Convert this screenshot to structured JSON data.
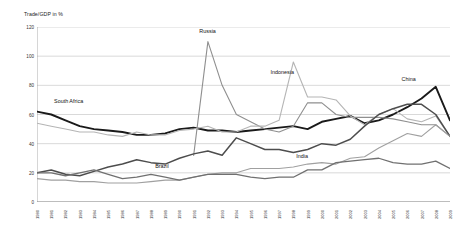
{
  "chart_data": {
    "type": "line",
    "title": "",
    "ylabel": "Trade/GDP in %",
    "xlabel": "",
    "ylim": [
      0,
      120
    ],
    "yticks": [
      0,
      20,
      40,
      60,
      80,
      100,
      120
    ],
    "grid": true,
    "legend_position": "inline-annotations",
    "x": [
      1980,
      1981,
      1982,
      1983,
      1984,
      1985,
      1986,
      1987,
      1988,
      1989,
      1990,
      1991,
      1992,
      1993,
      1994,
      1995,
      1996,
      1997,
      1998,
      1999,
      2000,
      2001,
      2002,
      2003,
      2004,
      2005,
      2006,
      2007,
      2008,
      2009
    ],
    "series": [
      {
        "name": "South Africa",
        "color": "#1a1a1a",
        "width": 1.9,
        "label_x": 1981.2,
        "label_y": 68,
        "values": [
          62,
          60,
          56,
          52,
          50,
          49,
          48,
          46,
          46,
          47,
          50,
          51,
          49,
          49,
          48,
          49,
          50,
          51,
          52,
          50,
          55,
          57,
          59,
          54,
          56,
          60,
          65,
          71,
          79,
          56
        ]
      },
      {
        "name": "Russia",
        "color": "#8f8f8f",
        "width": 1.1,
        "label_x": 1991.4,
        "label_y": 116,
        "values": [
          null,
          null,
          null,
          null,
          null,
          null,
          null,
          null,
          null,
          null,
          null,
          32,
          110,
          80,
          60,
          55,
          50,
          48,
          52,
          68,
          68,
          60,
          58,
          58,
          58,
          57,
          55,
          53,
          53,
          45
        ]
      },
      {
        "name": "Indonesia",
        "color": "#b5b5b5",
        "width": 1.1,
        "label_x": 1996.4,
        "label_y": 88,
        "values": [
          54,
          52,
          50,
          48,
          48,
          46,
          45,
          48,
          46,
          46,
          49,
          50,
          52,
          48,
          48,
          52,
          52,
          56,
          96,
          72,
          72,
          70,
          59,
          53,
          60,
          64,
          57,
          55,
          59,
          45
        ]
      },
      {
        "name": "China",
        "color": "#4d4d4d",
        "width": 1.5,
        "label_x": 2005.6,
        "label_y": 83,
        "values": [
          20,
          22,
          19,
          18,
          21,
          24,
          26,
          29,
          27,
          26,
          30,
          33,
          35,
          32,
          44,
          40,
          36,
          36,
          34,
          36,
          40,
          39,
          43,
          52,
          60,
          64,
          67,
          67,
          60,
          45
        ]
      },
      {
        "name": "India",
        "color": "#a0a0a0",
        "width": 1.1,
        "label_x": 1998.2,
        "label_y": 30,
        "values": [
          16,
          15,
          15,
          14,
          14,
          13,
          13,
          13,
          14,
          15,
          15,
          17,
          19,
          20,
          20,
          23,
          23,
          23,
          24,
          26,
          27,
          26,
          30,
          31,
          37,
          42,
          47,
          45,
          53,
          45
        ]
      },
      {
        "name": "Brazil",
        "color": "#707070",
        "width": 1.3,
        "label_x": 1988.3,
        "label_y": 23,
        "values": [
          20,
          20,
          18,
          20,
          22,
          19,
          16,
          17,
          19,
          17,
          15,
          17,
          19,
          19,
          19,
          17,
          16,
          17,
          17,
          22,
          22,
          27,
          28,
          29,
          30,
          27,
          26,
          26,
          28,
          23
        ]
      }
    ],
    "annotations": [
      {
        "text": "South Africa",
        "x": 1981.2,
        "y": 68
      },
      {
        "text": "Russia",
        "x": 1991.4,
        "y": 116
      },
      {
        "text": "Indonesia",
        "x": 1996.4,
        "y": 88
      },
      {
        "text": "China",
        "x": 2005.6,
        "y": 83
      },
      {
        "text": "India",
        "x": 1998.2,
        "y": 30
      },
      {
        "text": "Brazil",
        "x": 1988.3,
        "y": 23
      }
    ]
  }
}
